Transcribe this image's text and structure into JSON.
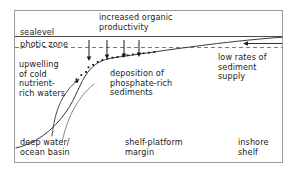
{
  "figure": {
    "type": "cross-section-diagram",
    "background_color": "#ffffff",
    "frame_color": "#9a9a9a",
    "ink_color": "#1a1a1a"
  },
  "labels": {
    "increased_organic_productivity": "increased organic\nproductivity",
    "sealevel": "sealevel",
    "photic_zone": "photic zone",
    "upwelling": "upwelling\nof cold\nnutrient-\nrich waters",
    "deposition": "deposition of\nphosphate-rich\nsediments",
    "low_rates": "low rates of\nsediment\nsupply",
    "deep_water": "deep water/\nocean basin",
    "shelf_platform": "shelf-platform\nmargin",
    "inshore_shelf": "inshore\nshelf"
  },
  "lines": {
    "sealevel_line": {
      "style": "solid",
      "y": 36,
      "x_start": 15,
      "x_end": 282
    },
    "photic_zone_line": {
      "style": "dashed",
      "y": 47,
      "x_start": 15,
      "x_end": 282
    },
    "seafloor_profile": {
      "style": "solid",
      "description": "deep basin floor rising steeply through the slope to a gently inclined shelf"
    }
  },
  "arrows": {
    "organic_rain": {
      "direction": "down",
      "count": 4,
      "x_positions": [
        89,
        107,
        124,
        139
      ],
      "y_top": 40,
      "y_bottom": 61,
      "meaning": "organic matter settling from surface waters"
    },
    "upwelling_arrow": {
      "direction": "up-right",
      "curved": true,
      "meaning": "upwelling of cold nutrient-rich waters"
    },
    "sediment_supply_arrow": {
      "direction": "left",
      "y": 43,
      "x_tail": 282,
      "x_head": 244,
      "meaning": "low rates of terrigenous sediment supply from inshore"
    }
  },
  "sediment_dots": {
    "symbol": "square-dot",
    "count": 17,
    "meaning": "phosphate-rich sediment grains deposited along the shelf break"
  }
}
